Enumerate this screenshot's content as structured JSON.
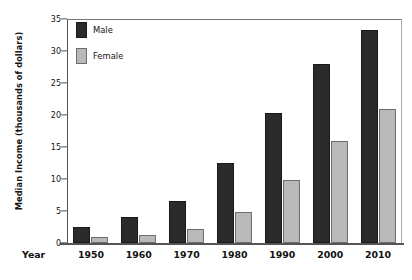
{
  "chart_data": {
    "type": "bar",
    "title": "",
    "subtitle": "",
    "xlabel": "Year",
    "ylabel": "Median Income (thousands of dollars)",
    "categories": [
      "1950",
      "1960",
      "1970",
      "1980",
      "1990",
      "2000",
      "2010"
    ],
    "series": [
      {
        "name": "Male",
        "color": "#2b2b2b",
        "values": [
          2.5,
          4.1,
          6.6,
          12.5,
          20.3,
          28.0,
          33.3
        ]
      },
      {
        "name": "Female",
        "color": "#b9b9b9",
        "values": [
          1.0,
          1.3,
          2.2,
          4.9,
          9.9,
          16.0,
          20.9
        ]
      }
    ],
    "ylim": [
      0,
      35
    ],
    "yticks": [
      0,
      5,
      10,
      15,
      20,
      25,
      30,
      35
    ],
    "ytick_labels": [
      "0",
      "5",
      "10",
      "15",
      "20",
      "25",
      "30",
      "35"
    ],
    "grid": false,
    "legend_position": "top-left",
    "legend_entries": [
      "Male",
      "Female"
    ]
  }
}
